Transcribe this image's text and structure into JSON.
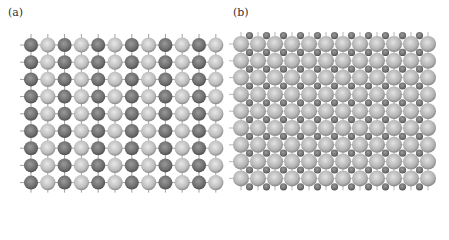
{
  "panels": [
    {
      "label": "(a)",
      "label_pos": [
        8,
        6
      ],
      "description": "Square lattice of alternating dark and light spheres",
      "cols": 12,
      "rows": 9,
      "x0": 31,
      "dx": 16.8,
      "y0": 45,
      "dy": 17.2,
      "large_r": 7.6,
      "dark_color": "#6e6e6e",
      "light_color": "#bdbdbd"
    },
    {
      "label": "(b)",
      "label_pos": [
        233,
        6
      ],
      "description": "Square lattice of large light spheres with small dark spheres in interstitial sites",
      "cols": 12,
      "rows": 9,
      "x0": 241,
      "dx": 17,
      "y0": 44,
      "dy": 16.8,
      "large_r": 8,
      "small_r": 3.6,
      "large_color": "#b8b8b8",
      "small_color": "#6a6a6a"
    }
  ]
}
